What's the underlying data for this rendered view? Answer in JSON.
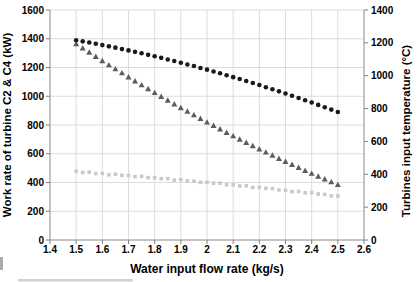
{
  "chart_data": {
    "type": "scatter",
    "title": "",
    "xlabel": "Water input flow rate (kg/s)",
    "ylabel_left": "Work rate of turbine C2 & C4 (kW)",
    "ylabel_right": "Turbines input temperature (°C)",
    "xlim": [
      1.4,
      2.6
    ],
    "ylim_left": [
      0,
      1600
    ],
    "ylim_right": [
      0,
      1400
    ],
    "x_ticks": [
      "1.4",
      "1.5",
      "1.6",
      "1.7",
      "1.8",
      "1.9",
      "2",
      "2.1",
      "2.2",
      "2.3",
      "2.4",
      "2.5",
      "2.6"
    ],
    "y_ticks_left": [
      0,
      200,
      400,
      600,
      800,
      1000,
      1200,
      1400,
      1600
    ],
    "y_ticks_right": [
      0,
      200,
      400,
      600,
      800,
      1000,
      1200,
      1400
    ],
    "grid": true,
    "legend": "none",
    "x": [
      1.5,
      1.525,
      1.55,
      1.575,
      1.6,
      1.625,
      1.65,
      1.675,
      1.7,
      1.725,
      1.75,
      1.775,
      1.8,
      1.825,
      1.85,
      1.875,
      1.9,
      1.925,
      1.95,
      1.975,
      2.0,
      2.025,
      2.05,
      2.075,
      2.1,
      2.125,
      2.15,
      2.175,
      2.2,
      2.225,
      2.25,
      2.275,
      2.3,
      2.325,
      2.35,
      2.375,
      2.4,
      2.425,
      2.45,
      2.475,
      2.5
    ],
    "series": [
      {
        "name": "black-circles",
        "marker": "circle",
        "color": "#1a1a1a",
        "axis": "left",
        "values": [
          1390,
          1382,
          1374,
          1365,
          1356,
          1347,
          1338,
          1328,
          1319,
          1309,
          1299,
          1288,
          1278,
          1267,
          1256,
          1245,
          1233,
          1221,
          1210,
          1197,
          1185,
          1172,
          1160,
          1146,
          1133,
          1120,
          1106,
          1092,
          1078,
          1063,
          1049,
          1034,
          1019,
          1003,
          988,
          972,
          956,
          940,
          924,
          907,
          890
        ]
      },
      {
        "name": "gray-triangles",
        "marker": "triangle",
        "color": "#5c5c5c",
        "axis": "left",
        "values": [
          1365,
          1335,
          1306,
          1276,
          1247,
          1218,
          1190,
          1162,
          1134,
          1106,
          1079,
          1052,
          1025,
          998,
          972,
          946,
          920,
          895,
          870,
          845,
          820,
          796,
          772,
          748,
          724,
          701,
          678,
          655,
          633,
          611,
          589,
          567,
          546,
          525,
          504,
          483,
          463,
          443,
          424,
          404,
          385
        ]
      },
      {
        "name": "light-gray-squares",
        "marker": "square",
        "color": "#c9c9c9",
        "axis": "left",
        "values": [
          478,
          470,
          472,
          462,
          463,
          454,
          458,
          450,
          449,
          441,
          444,
          434,
          433,
          426,
          427,
          417,
          420,
          411,
          409,
          401,
          402,
          395,
          395,
          384,
          384,
          376,
          377,
          365,
          366,
          359,
          358,
          348,
          346,
          337,
          338,
          328,
          330,
          320,
          317,
          307,
          306
        ]
      }
    ],
    "colors": {
      "background": "#ffffff",
      "gridline": "#dcdcdc",
      "axis_line": "#9b9b9b",
      "tick_mark": "#808080",
      "text": "#000000"
    }
  }
}
